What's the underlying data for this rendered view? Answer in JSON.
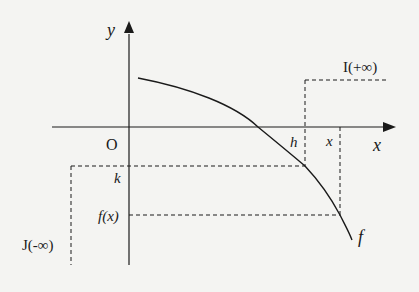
{
  "diagram": {
    "type": "function-graph",
    "colors": {
      "background": "#f4f4f2",
      "ink": "#1a1a1a"
    },
    "axes": {
      "x_label": "x",
      "y_label": "y",
      "origin_label": "O"
    },
    "curve": {
      "label": "f",
      "description": "decreasing concave-down curve starting above origin, crossing x-axis, continuing downward"
    },
    "marks": {
      "h": "h",
      "x": "x",
      "k": "k",
      "fx": "f(x)"
    },
    "regions": {
      "I": "I(+∞)",
      "J": "J(-∞)"
    }
  }
}
